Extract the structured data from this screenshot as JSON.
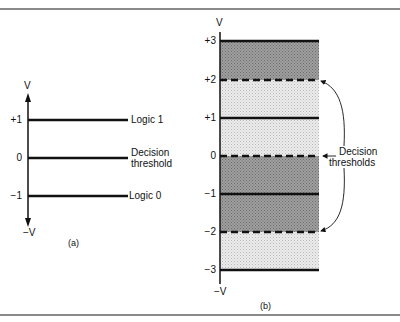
{
  "figure": {
    "panel_a": {
      "caption": "(a)",
      "axis_top_label": "V",
      "axis_bottom_label": "−V",
      "levels": [
        {
          "tick": "+1",
          "label": "Logic 1"
        },
        {
          "tick": "0",
          "label_line1": "Decision",
          "label_line2": "threshold"
        },
        {
          "tick": "−1",
          "label": "Logic 0"
        }
      ]
    },
    "panel_b": {
      "caption": "(b)",
      "axis_top_label": "V",
      "axis_bottom_label": "−V",
      "ticks": [
        "+3",
        "+2",
        "+1",
        "0",
        "−1",
        "−2",
        "−3"
      ],
      "annotation_line1": "Decision",
      "annotation_line2": "thresholds",
      "colors": {
        "dark_band": "#8f8f8f",
        "light_band": "#dcdcdc",
        "line": "#111111"
      }
    }
  }
}
